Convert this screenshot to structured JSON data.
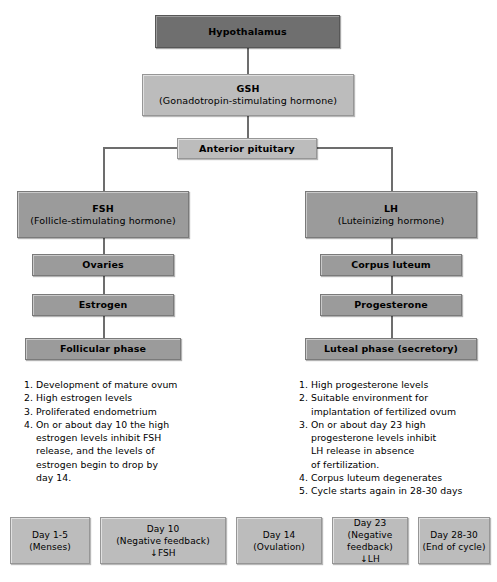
{
  "diagram": {
    "colors": {
      "box_fill": "#9b9b9b",
      "box_fill_dark": "#6f6f6f",
      "box_fill_light": "#bcbcbc",
      "border": "#7a7a7a",
      "connector": "#6d6d6d",
      "text": "#000000",
      "background": "#ffffff"
    }
  },
  "nodes": {
    "hypothalamus": {
      "title": "Hypothalamus",
      "subtitle": ""
    },
    "gsh": {
      "title": "GSH",
      "subtitle": "(Gonadotropin-stimulating hormone)"
    },
    "anterior_pituitary": {
      "title": "Anterior pituitary",
      "subtitle": ""
    },
    "fsh": {
      "title": "FSH",
      "subtitle": "(Follicle-stimulating hormone)"
    },
    "lh": {
      "title": "LH",
      "subtitle": "(Luteinizing hormone)"
    },
    "ovaries": {
      "title": "Ovaries",
      "subtitle": ""
    },
    "corpus_luteum": {
      "title": "Corpus luteum",
      "subtitle": ""
    },
    "estrogen": {
      "title": "Estrogen",
      "subtitle": ""
    },
    "progesterone": {
      "title": "Progesterone",
      "subtitle": ""
    },
    "follicular_phase": {
      "title": "Follicular phase",
      "subtitle": ""
    },
    "luteal_phase": {
      "title": "Luteal phase (secretory)",
      "subtitle": ""
    }
  },
  "left_list": {
    "items": [
      {
        "num": "1.",
        "text": "Development of mature ovum",
        "cont": []
      },
      {
        "num": "2.",
        "text": "High estrogen levels",
        "cont": []
      },
      {
        "num": "3.",
        "text": "Proliferated endometrium",
        "cont": []
      },
      {
        "num": "4.",
        "text": "On or about day 10 the high",
        "cont": [
          "estrogen levels inhibit FSH",
          "release, and the levels of",
          "estrogen begin to drop by",
          "day 14."
        ]
      }
    ]
  },
  "right_list": {
    "items": [
      {
        "num": "1.",
        "text": "High progesterone levels",
        "cont": []
      },
      {
        "num": "2.",
        "text": "Suitable environment for",
        "cont": [
          "implantation of fertilized ovum"
        ]
      },
      {
        "num": "3.",
        "text": "On or about day 23 high",
        "cont": [
          "progesterone levels inhibit",
          "LH release in absence",
          "of fertilization."
        ]
      },
      {
        "num": "4.",
        "text": "Corpus luteum degenerates",
        "cont": []
      },
      {
        "num": "5.",
        "text": "Cycle starts again in 28-30 days",
        "cont": []
      }
    ]
  },
  "timeline": {
    "boxes": [
      {
        "line1": "Day 1-5",
        "line2": "(Menses)",
        "line3": ""
      },
      {
        "line1": "Day 10",
        "line2": "(Negative feedback)",
        "line3": "↓FSH"
      },
      {
        "line1": "Day 14",
        "line2": "(Ovulation)",
        "line3": ""
      },
      {
        "line1": "Day 23",
        "line2": "(Negative feedback)",
        "line3": "↓LH"
      },
      {
        "line1": "Day 28-30",
        "line2": "(End of cycle)",
        "line3": ""
      }
    ]
  }
}
